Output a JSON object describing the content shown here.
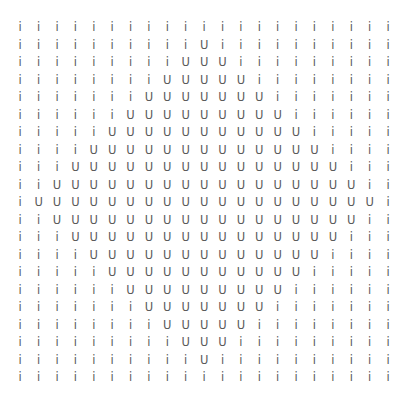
{
  "grid": {
    "rows": 21,
    "cols": 21,
    "cells": [
      [
        "i",
        "i",
        "i",
        "i",
        "i",
        "i",
        "i",
        "i",
        "i",
        "i",
        "i",
        "i",
        "i",
        "i",
        "i",
        "i",
        "i",
        "i",
        "i",
        "i",
        "i"
      ],
      [
        "i",
        "i",
        "i",
        "i",
        "i",
        "i",
        "i",
        "i",
        "i",
        "i",
        "U",
        "i",
        "i",
        "i",
        "i",
        "i",
        "i",
        "i",
        "i",
        "i",
        "i"
      ],
      [
        "i",
        "i",
        "i",
        "i",
        "i",
        "i",
        "i",
        "i",
        "i",
        "U",
        "U",
        "U",
        "i",
        "i",
        "i",
        "i",
        "i",
        "i",
        "i",
        "i",
        "i"
      ],
      [
        "i",
        "i",
        "i",
        "i",
        "i",
        "i",
        "i",
        "i",
        "U",
        "U",
        "U",
        "U",
        "U",
        "i",
        "i",
        "i",
        "i",
        "i",
        "i",
        "i",
        "i"
      ],
      [
        "i",
        "i",
        "i",
        "i",
        "i",
        "i",
        "i",
        "U",
        "U",
        "U",
        "U",
        "U",
        "U",
        "U",
        "i",
        "i",
        "i",
        "i",
        "i",
        "i",
        "i"
      ],
      [
        "i",
        "i",
        "i",
        "i",
        "i",
        "i",
        "U",
        "U",
        "U",
        "U",
        "U",
        "U",
        "U",
        "U",
        "U",
        "i",
        "i",
        "i",
        "i",
        "i",
        "i"
      ],
      [
        "i",
        "i",
        "i",
        "i",
        "i",
        "U",
        "U",
        "U",
        "U",
        "U",
        "U",
        "U",
        "U",
        "U",
        "U",
        "U",
        "i",
        "i",
        "i",
        "i",
        "i"
      ],
      [
        "i",
        "i",
        "i",
        "i",
        "U",
        "U",
        "U",
        "U",
        "U",
        "U",
        "U",
        "U",
        "U",
        "U",
        "U",
        "U",
        "U",
        "i",
        "i",
        "i",
        "i"
      ],
      [
        "i",
        "i",
        "i",
        "U",
        "U",
        "U",
        "U",
        "U",
        "U",
        "U",
        "U",
        "U",
        "U",
        "U",
        "U",
        "U",
        "U",
        "U",
        "i",
        "i",
        "i"
      ],
      [
        "i",
        "i",
        "U",
        "U",
        "U",
        "U",
        "U",
        "U",
        "U",
        "U",
        "U",
        "U",
        "U",
        "U",
        "U",
        "U",
        "U",
        "U",
        "U",
        "i",
        "i"
      ],
      [
        "i",
        "U",
        "U",
        "U",
        "U",
        "U",
        "U",
        "U",
        "U",
        "U",
        "U",
        "U",
        "U",
        "U",
        "U",
        "U",
        "U",
        "U",
        "U",
        "U",
        "i"
      ],
      [
        "i",
        "i",
        "U",
        "U",
        "U",
        "U",
        "U",
        "U",
        "U",
        "U",
        "U",
        "U",
        "U",
        "U",
        "U",
        "U",
        "U",
        "U",
        "U",
        "i",
        "i"
      ],
      [
        "i",
        "i",
        "i",
        "U",
        "U",
        "U",
        "U",
        "U",
        "U",
        "U",
        "U",
        "U",
        "U",
        "U",
        "U",
        "U",
        "U",
        "U",
        "i",
        "i",
        "i"
      ],
      [
        "i",
        "i",
        "i",
        "i",
        "U",
        "U",
        "U",
        "U",
        "U",
        "U",
        "U",
        "U",
        "U",
        "U",
        "U",
        "U",
        "U",
        "i",
        "i",
        "i",
        "i"
      ],
      [
        "i",
        "i",
        "i",
        "i",
        "i",
        "U",
        "U",
        "U",
        "U",
        "U",
        "U",
        "U",
        "U",
        "U",
        "U",
        "U",
        "i",
        "i",
        "i",
        "i",
        "i"
      ],
      [
        "i",
        "i",
        "i",
        "i",
        "i",
        "i",
        "U",
        "U",
        "U",
        "U",
        "U",
        "U",
        "U",
        "U",
        "U",
        "i",
        "i",
        "i",
        "i",
        "i",
        "i"
      ],
      [
        "i",
        "i",
        "i",
        "i",
        "i",
        "i",
        "i",
        "U",
        "U",
        "U",
        "U",
        "U",
        "U",
        "U",
        "i",
        "i",
        "i",
        "i",
        "i",
        "i",
        "i"
      ],
      [
        "i",
        "i",
        "i",
        "i",
        "i",
        "i",
        "i",
        "i",
        "U",
        "U",
        "U",
        "U",
        "U",
        "i",
        "i",
        "i",
        "i",
        "i",
        "i",
        "i",
        "i"
      ],
      [
        "i",
        "i",
        "i",
        "i",
        "i",
        "i",
        "i",
        "i",
        "i",
        "U",
        "U",
        "U",
        "i",
        "i",
        "i",
        "i",
        "i",
        "i",
        "i",
        "i",
        "i"
      ],
      [
        "i",
        "i",
        "i",
        "i",
        "i",
        "i",
        "i",
        "i",
        "i",
        "i",
        "U",
        "i",
        "i",
        "i",
        "i",
        "i",
        "i",
        "i",
        "i",
        "i",
        "i"
      ],
      [
        "i",
        "i",
        "i",
        "i",
        "i",
        "i",
        "i",
        "i",
        "i",
        "i",
        "i",
        "i",
        "i",
        "i",
        "i",
        "i",
        "i",
        "i",
        "i",
        "i",
        "i"
      ]
    ]
  }
}
